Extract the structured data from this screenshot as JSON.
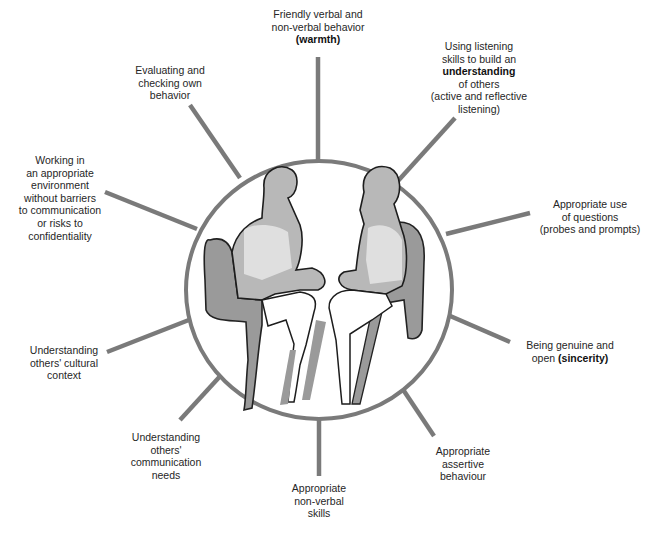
{
  "diagram": {
    "type": "hub-and-spoke",
    "center": {
      "illustration": "two-people-seated-in-armchairs-facing-each-other",
      "ellipse": {
        "cx": 319,
        "cy": 290,
        "rx": 133,
        "ry": 129
      },
      "stroke_color": "#7a7a7a",
      "fill_color": "#ffffff"
    },
    "spoke_color": "#7a7a7a",
    "nodes": [
      {
        "id": "warmth",
        "lines": [
          "Friendly verbal and",
          "non-verbal behavior"
        ],
        "bold": "(warmth)"
      },
      {
        "id": "understanding",
        "lines": [
          "Using listening",
          "skills to build an"
        ],
        "bold": "understanding",
        "after": [
          "of others",
          "(active and reflective",
          "listening)"
        ]
      },
      {
        "id": "questions",
        "lines": [
          "Appropriate use",
          "of questions",
          "(probes and prompts)"
        ]
      },
      {
        "id": "sincerity",
        "lines": [
          "Being genuine and"
        ],
        "inline_prefix": "open ",
        "bold": "(sincerity)"
      },
      {
        "id": "assertive",
        "lines": [
          "Appropriate",
          "assertive",
          "behaviour"
        ]
      },
      {
        "id": "nonverbal",
        "lines": [
          "Appropriate",
          "non-verbal",
          "skills"
        ]
      },
      {
        "id": "communication-needs",
        "lines": [
          "Understanding",
          "others'",
          "communication",
          "needs"
        ]
      },
      {
        "id": "cultural",
        "lines": [
          "Understanding",
          "others' cultural",
          "context"
        ]
      },
      {
        "id": "environment",
        "lines": [
          "Working in",
          "an appropriate",
          "environment",
          "without barriers",
          "to communication",
          "or risks to",
          "confidentiality"
        ]
      },
      {
        "id": "evaluating",
        "lines": [
          "Evaluating and",
          "checking own",
          "behavior"
        ]
      }
    ],
    "labels": {
      "warmth_l1": "Friendly verbal and",
      "warmth_l2": "non-verbal behavior",
      "warmth_bold": "(warmth)",
      "understanding_l1": "Using listening",
      "understanding_l2": "skills to build an",
      "understanding_bold": "understanding",
      "understanding_l3": "of others",
      "understanding_l4": "(active and reflective",
      "understanding_l5": "listening)",
      "questions_l1": "Appropriate use",
      "questions_l2": "of questions",
      "questions_l3": "(probes and prompts)",
      "sincerity_l1": "Being genuine and",
      "sincerity_prefix": "open ",
      "sincerity_bold": "(sincerity)",
      "assertive_l1": "Appropriate",
      "assertive_l2": "assertive",
      "assertive_l3": "behaviour",
      "nonverbal_l1": "Appropriate",
      "nonverbal_l2": "non-verbal",
      "nonverbal_l3": "skills",
      "commneeds_l1": "Understanding",
      "commneeds_l2": "others'",
      "commneeds_l3": "communication",
      "commneeds_l4": "needs",
      "cultural_l1": "Understanding",
      "cultural_l2": "others' cultural",
      "cultural_l3": "context",
      "env_l1": "Working in",
      "env_l2": "an appropriate",
      "env_l3": "environment",
      "env_l4": "without barriers",
      "env_l5": "to communication",
      "env_l6": "or risks to",
      "env_l7": "confidentiality",
      "eval_l1": "Evaluating and",
      "eval_l2": "checking own",
      "eval_l3": "behavior"
    }
  }
}
